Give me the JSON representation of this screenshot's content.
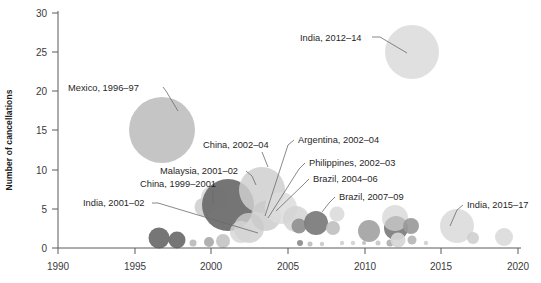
{
  "chart_data": {
    "type": "scatter",
    "title": "",
    "xlabel": "",
    "ylabel": "Number of cancellations",
    "xlim": [
      1990,
      2020
    ],
    "ylim": [
      0,
      30
    ],
    "xticks": [
      "1990",
      "1995",
      "2000",
      "2005",
      "2010",
      "2015",
      "2020"
    ],
    "yticks": [
      "0",
      "5",
      "10",
      "15",
      "20",
      "25",
      "30"
    ],
    "grid": false,
    "legend": "none",
    "note": "Bubble chart: x = year, y = number of cancellations, bubble area = magnitude",
    "annotations": [
      {
        "label": "Mexico, 1996–97",
        "x": 1996.5,
        "y": 13.5,
        "r": 33
      },
      {
        "label": "India, 2012–14",
        "x": 2013.0,
        "y": 25.0,
        "r": 27
      },
      {
        "label": "China, 2002–04",
        "x": 2003.0,
        "y": 8.0,
        "r": 23
      },
      {
        "label": "Argentina, 2002–04",
        "x": 2003.5,
        "y": 4.0,
        "r": 15
      },
      {
        "label": "Philippines, 2002–03",
        "x": 2002.8,
        "y": 3.0,
        "r": 10
      },
      {
        "label": "Brazil, 2004–06",
        "x": 2005.0,
        "y": 3.5,
        "r": 13
      },
      {
        "label": "Brazil, 2007–09",
        "x": 2008.2,
        "y": 4.2,
        "r": 8
      },
      {
        "label": "Malaysia, 2001–02",
        "x": 2001.5,
        "y": 4.5,
        "r": 7
      },
      {
        "label": "China, 1999–2001",
        "x": 2000.8,
        "y": 6.0,
        "r": 26
      },
      {
        "label": "India, 2001–02",
        "x": 2001.8,
        "y": 1.0,
        "r": 6
      },
      {
        "label": "India, 2015–17",
        "x": 2016.0,
        "y": 2.5,
        "r": 17
      }
    ],
    "bubbles": [
      {
        "cx": 159,
        "cy": 238,
        "r": 10.5,
        "fill": "#6f6f6f",
        "o": 0.95
      },
      {
        "cx": 177,
        "cy": 240,
        "r": 8.5,
        "fill": "#6f6f6f",
        "o": 0.95
      },
      {
        "cx": 193,
        "cy": 243,
        "r": 3.5,
        "fill": "#b9b9b9",
        "o": 0.9
      },
      {
        "cx": 209,
        "cy": 242,
        "r": 5.0,
        "fill": "#a8a8a8",
        "o": 0.9
      },
      {
        "cx": 223,
        "cy": 241,
        "r": 7.0,
        "fill": "#c3c3c3",
        "o": 0.9
      },
      {
        "cx": 162,
        "cy": 130,
        "r": 33,
        "fill": "#c2c2c2",
        "o": 0.95
      },
      {
        "cx": 204,
        "cy": 207,
        "r": 9.5,
        "fill": "#cfcfcf",
        "o": 0.9
      },
      {
        "cx": 214,
        "cy": 198,
        "r": 13,
        "fill": "#d8d8d8",
        "o": 0.85
      },
      {
        "cx": 228,
        "cy": 205,
        "r": 26,
        "fill": "#6e6e6e",
        "o": 0.95
      },
      {
        "cx": 249,
        "cy": 228,
        "r": 15,
        "fill": "#cdcdcd",
        "o": 0.8
      },
      {
        "cx": 241,
        "cy": 232,
        "r": 11,
        "fill": "#d5d5d5",
        "o": 0.8
      },
      {
        "cx": 262,
        "cy": 190,
        "r": 23,
        "fill": "#cfcfcf",
        "o": 0.85
      },
      {
        "cx": 266,
        "cy": 216,
        "r": 15,
        "fill": "#c9c9c9",
        "o": 0.8
      },
      {
        "cx": 281,
        "cy": 208,
        "r": 16,
        "fill": "#dcdcdc",
        "o": 0.85
      },
      {
        "cx": 296,
        "cy": 219,
        "r": 13,
        "fill": "#d3d3d3",
        "o": 0.85
      },
      {
        "cx": 300,
        "cy": 243,
        "r": 3.0,
        "fill": "#8a8a8a",
        "o": 0.9
      },
      {
        "cx": 310,
        "cy": 244,
        "r": 2.5,
        "fill": "#bdbdbd",
        "o": 0.9
      },
      {
        "cx": 322,
        "cy": 244,
        "r": 2.2,
        "fill": "#c9c9c9",
        "o": 0.9
      },
      {
        "cx": 299,
        "cy": 226,
        "r": 7.5,
        "fill": "#8f8f8f",
        "o": 0.9
      },
      {
        "cx": 316,
        "cy": 223,
        "r": 12,
        "fill": "#7d7d7d",
        "o": 0.95
      },
      {
        "cx": 333,
        "cy": 228,
        "r": 7.0,
        "fill": "#bfbfbf",
        "o": 0.9
      },
      {
        "cx": 337,
        "cy": 214,
        "r": 7.5,
        "fill": "#d9d9d9",
        "o": 0.85
      },
      {
        "cx": 342,
        "cy": 243,
        "r": 2.2,
        "fill": "#cfcfcf",
        "o": 0.9
      },
      {
        "cx": 353,
        "cy": 243,
        "r": 2.2,
        "fill": "#d2d2d2",
        "o": 0.9
      },
      {
        "cx": 369,
        "cy": 231,
        "r": 11,
        "fill": "#a3a3a3",
        "o": 0.92
      },
      {
        "cx": 364,
        "cy": 243,
        "r": 2.0,
        "fill": "#bdbdbd",
        "o": 0.9
      },
      {
        "cx": 378,
        "cy": 243,
        "r": 2.5,
        "fill": "#c7c7c7",
        "o": 0.9
      },
      {
        "cx": 390,
        "cy": 243,
        "r": 3.5,
        "fill": "#adadad",
        "o": 0.9
      },
      {
        "cx": 396,
        "cy": 228,
        "r": 12,
        "fill": "#7f7f7f",
        "o": 0.95
      },
      {
        "cx": 395,
        "cy": 218,
        "r": 13,
        "fill": "#d3d3d3",
        "o": 0.7
      },
      {
        "cx": 398,
        "cy": 240,
        "r": 7.5,
        "fill": "#d6d6d6",
        "o": 0.92
      },
      {
        "cx": 411,
        "cy": 226,
        "r": 8.0,
        "fill": "#9a9a9a",
        "o": 0.92
      },
      {
        "cx": 412,
        "cy": 240,
        "r": 4.5,
        "fill": "#b5b5b5",
        "o": 0.9
      },
      {
        "cx": 412,
        "cy": 52,
        "r": 27,
        "fill": "#dedede",
        "o": 0.95
      },
      {
        "cx": 426,
        "cy": 243,
        "r": 2.2,
        "fill": "#d0d0d0",
        "o": 0.9
      },
      {
        "cx": 457,
        "cy": 226,
        "r": 17,
        "fill": "#dcdcdc",
        "o": 0.9
      },
      {
        "cx": 473,
        "cy": 238,
        "r": 6.0,
        "fill": "#cfcfcf",
        "o": 0.9
      },
      {
        "cx": 504,
        "cy": 237,
        "r": 9.0,
        "fill": "#dadada",
        "o": 0.9
      }
    ]
  },
  "axes": {
    "ylabel": "Number of cancellations",
    "yticks": [
      {
        "label": "30",
        "y": 13
      },
      {
        "label": "25",
        "y": 52
      },
      {
        "label": "20",
        "y": 91
      },
      {
        "label": "15",
        "y": 130
      },
      {
        "label": "10",
        "y": 170
      },
      {
        "label": "5",
        "y": 209
      },
      {
        "label": "0",
        "y": 248
      }
    ],
    "xticks": [
      {
        "label": "1990",
        "x": 58
      },
      {
        "label": "1995",
        "x": 135
      },
      {
        "label": "2000",
        "x": 211
      },
      {
        "label": "2005",
        "x": 288
      },
      {
        "label": "2010",
        "x": 365
      },
      {
        "label": "2015",
        "x": 441
      },
      {
        "label": "2020",
        "x": 518
      }
    ]
  },
  "labels": [
    {
      "name": "mexico",
      "text": "Mexico, 1996–97",
      "tx": 68,
      "ty": 91,
      "anchor": "start",
      "leader": "M163,87 L166,91 L178,111"
    },
    {
      "name": "india-2012",
      "text": "India, 2012–14",
      "tx": 300,
      "ty": 41,
      "anchor": "start",
      "leader": "M372,37 L380,37 L407,53"
    },
    {
      "name": "china-2002",
      "text": "China, 2002–04",
      "tx": 203,
      "ty": 148,
      "anchor": "start",
      "leader": "M262,152 L268,167"
    },
    {
      "name": "argentina",
      "text": "Argentina, 2002–04",
      "tx": 298,
      "ty": 143,
      "anchor": "start",
      "leader": "M294,140 L288,145 L265,216"
    },
    {
      "name": "philippines",
      "text": "Philippines, 2002–03",
      "tx": 309,
      "ty": 166,
      "anchor": "start",
      "leader": "M305,163 L299,169 L268,218"
    },
    {
      "name": "brazil-2004",
      "text": "Brazil, 2004–06",
      "tx": 313,
      "ty": 182,
      "anchor": "start",
      "leader": "M309,179 L303,185 L276,211"
    },
    {
      "name": "brazil-2007",
      "text": "Brazil, 2007–09",
      "tx": 339,
      "ty": 200,
      "anchor": "start",
      "leader": "M335,197 L329,203 L322,212"
    },
    {
      "name": "malaysia",
      "text": "Malaysia, 2001–02",
      "tx": 160,
      "ty": 174,
      "anchor": "start",
      "leader": "M246,171 L252,176 L256,185"
    },
    {
      "name": "china-1999",
      "text": "China, 1999–2001",
      "tx": 140,
      "ty": 187,
      "anchor": "start",
      "leader": "M213,190 L213,203"
    },
    {
      "name": "india-2001",
      "text": "India, 2001–02",
      "tx": 83,
      "ty": 206,
      "anchor": "start",
      "leader": "M152,203 L158,203 L258,233"
    },
    {
      "name": "india-2015",
      "text": "India, 2015–17",
      "tx": 467,
      "ty": 208,
      "anchor": "start",
      "leader": "M463,205 L457,210 L450,226"
    }
  ]
}
